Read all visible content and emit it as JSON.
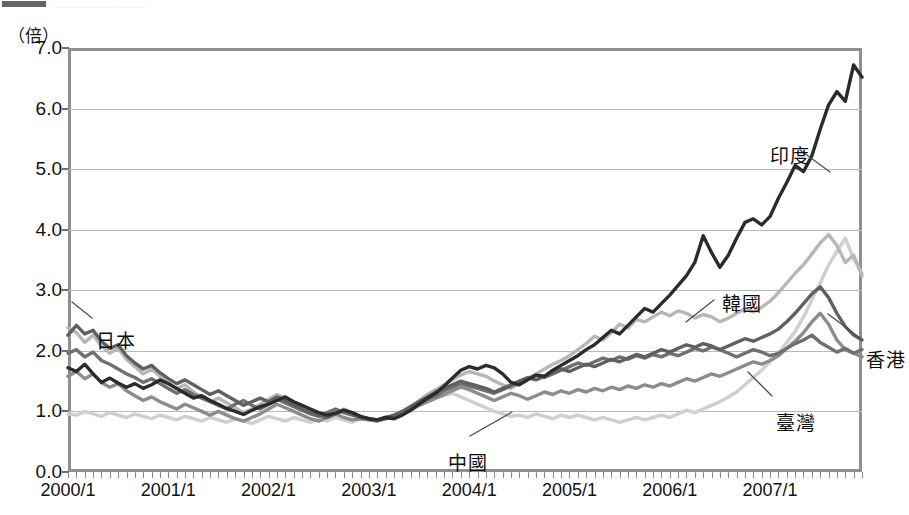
{
  "top_sliver": {
    "ghost_text": "................................."
  },
  "chart_data": {
    "type": "line",
    "title": "",
    "subtitle": "",
    "xlabel": "",
    "ylabel": "（倍）",
    "unit_label": "（倍）",
    "ylim": [
      0.0,
      7.0
    ],
    "ytick_labels": [
      "0.0",
      "1.0",
      "2.0",
      "3.0",
      "4.0",
      "5.0",
      "6.0",
      "7.0"
    ],
    "ytick_values": [
      0.0,
      1.0,
      2.0,
      3.0,
      4.0,
      5.0,
      6.0,
      7.0
    ],
    "grid": true,
    "legend_position": "inline-annotations",
    "xtick_labels": [
      "2000/1",
      "2001/1",
      "2002/1",
      "2003/1",
      "2004/1",
      "2005/1",
      "2006/1",
      "2007/1"
    ],
    "xtick_values": [
      0,
      12,
      24,
      36,
      48,
      60,
      72,
      84
    ],
    "x_minor_ticks": "monthly",
    "x_range_months": [
      0,
      95
    ],
    "series": [
      {
        "name": "印度",
        "name_en": "India",
        "color": "#2b2b2b",
        "width": 3.4,
        "label_x": 770,
        "label_y": 141,
        "leader": "M 800,150 L 830,172",
        "values": [
          1.72,
          1.66,
          1.78,
          1.62,
          1.48,
          1.55,
          1.47,
          1.4,
          1.46,
          1.38,
          1.44,
          1.52,
          1.46,
          1.38,
          1.3,
          1.22,
          1.26,
          1.18,
          1.12,
          1.05,
          1.0,
          0.95,
          1.02,
          1.08,
          1.12,
          1.18,
          1.24,
          1.16,
          1.1,
          1.04,
          0.98,
          0.94,
          0.97,
          1.02,
          0.98,
          0.92,
          0.88,
          0.86,
          0.9,
          0.88,
          0.94,
          1.02,
          1.12,
          1.22,
          1.3,
          1.42,
          1.55,
          1.68,
          1.74,
          1.7,
          1.76,
          1.72,
          1.62,
          1.48,
          1.44,
          1.52,
          1.6,
          1.58,
          1.68,
          1.76,
          1.84,
          1.92,
          2.02,
          2.1,
          2.22,
          2.34,
          2.28,
          2.42,
          2.56,
          2.7,
          2.64,
          2.78,
          2.92,
          3.08,
          3.24,
          3.46,
          3.9,
          3.62,
          3.38,
          3.58,
          3.86,
          4.12,
          4.18,
          4.08,
          4.22,
          4.52,
          4.78,
          5.06,
          4.96,
          5.22,
          5.66,
          6.06,
          6.28,
          6.12,
          6.72,
          6.52
        ]
      },
      {
        "name": "韓國",
        "name_en": "Korea",
        "color": "#b7b7b7",
        "width": 3.4,
        "label_x": 722,
        "label_y": 289,
        "leader": "M 714,300 L 686,322",
        "values": [
          2.38,
          2.3,
          2.14,
          2.26,
          2.08,
          1.96,
          2.04,
          1.86,
          1.74,
          1.62,
          1.7,
          1.58,
          1.46,
          1.38,
          1.44,
          1.32,
          1.24,
          1.16,
          1.22,
          1.14,
          1.06,
          0.98,
          1.04,
          1.12,
          1.2,
          1.28,
          1.22,
          1.14,
          1.08,
          1.02,
          0.96,
          0.92,
          0.98,
          1.04,
          0.98,
          0.92,
          0.88,
          0.85,
          0.9,
          0.92,
          0.98,
          1.08,
          1.18,
          1.28,
          1.36,
          1.44,
          1.52,
          1.6,
          1.66,
          1.62,
          1.58,
          1.5,
          1.44,
          1.38,
          1.46,
          1.54,
          1.62,
          1.7,
          1.78,
          1.84,
          1.92,
          2.02,
          2.12,
          2.24,
          2.18,
          2.3,
          2.44,
          2.38,
          2.52,
          2.48,
          2.56,
          2.64,
          2.58,
          2.66,
          2.62,
          2.54,
          2.6,
          2.56,
          2.48,
          2.54,
          2.62,
          2.7,
          2.64,
          2.72,
          2.82,
          2.96,
          3.12,
          3.28,
          3.42,
          3.6,
          3.78,
          3.92,
          3.74,
          3.46,
          3.58,
          3.24
        ]
      },
      {
        "name": "香港",
        "name_en": "Hong Kong",
        "color": "#707070",
        "width": 3.4,
        "label_x": 866,
        "label_y": 345,
        "leader": "M 860,338 L 828,314",
        "values": [
          1.96,
          2.02,
          1.9,
          1.98,
          1.84,
          1.78,
          1.7,
          1.62,
          1.56,
          1.48,
          1.54,
          1.46,
          1.38,
          1.3,
          1.36,
          1.28,
          1.22,
          1.16,
          1.1,
          1.04,
          1.12,
          1.18,
          1.1,
          1.04,
          1.12,
          1.2,
          1.14,
          1.08,
          1.02,
          0.96,
          0.92,
          0.98,
          1.04,
          0.98,
          0.94,
          0.9,
          0.87,
          0.85,
          0.88,
          0.92,
          0.96,
          1.04,
          1.12,
          1.2,
          1.26,
          1.34,
          1.4,
          1.46,
          1.42,
          1.38,
          1.34,
          1.3,
          1.36,
          1.42,
          1.48,
          1.54,
          1.6,
          1.56,
          1.62,
          1.68,
          1.74,
          1.8,
          1.76,
          1.82,
          1.88,
          1.84,
          1.9,
          1.86,
          1.92,
          1.88,
          1.94,
          1.9,
          1.96,
          1.92,
          1.98,
          2.04,
          2.0,
          2.06,
          2.02,
          1.96,
          1.9,
          1.96,
          2.02,
          1.98,
          1.92,
          1.96,
          2.04,
          2.12,
          2.18,
          2.26,
          2.14,
          2.06,
          1.98,
          2.04,
          1.96,
          2.02
        ]
      },
      {
        "name": "臺灣",
        "name_en": "Taiwan",
        "color": "#8c8c8c",
        "width": 3.4,
        "label_x": 776,
        "label_y": 408,
        "leader": "M 772,396 L 748,372",
        "values": [
          1.58,
          1.66,
          1.54,
          1.62,
          1.48,
          1.4,
          1.46,
          1.34,
          1.26,
          1.18,
          1.24,
          1.16,
          1.1,
          1.04,
          1.12,
          1.06,
          1.0,
          0.94,
          1.0,
          0.94,
          0.88,
          0.84,
          0.9,
          0.96,
          1.04,
          1.12,
          1.06,
          1.0,
          0.94,
          0.88,
          0.84,
          0.9,
          0.96,
          0.9,
          0.86,
          0.88,
          0.86,
          0.84,
          0.88,
          0.9,
          0.96,
          1.02,
          1.1,
          1.16,
          1.22,
          1.28,
          1.34,
          1.4,
          1.36,
          1.3,
          1.24,
          1.18,
          1.24,
          1.3,
          1.26,
          1.2,
          1.26,
          1.32,
          1.28,
          1.34,
          1.3,
          1.36,
          1.32,
          1.38,
          1.34,
          1.4,
          1.36,
          1.42,
          1.38,
          1.44,
          1.4,
          1.46,
          1.42,
          1.48,
          1.54,
          1.5,
          1.56,
          1.62,
          1.58,
          1.64,
          1.7,
          1.76,
          1.82,
          1.78,
          1.84,
          1.92,
          2.04,
          2.16,
          2.3,
          2.48,
          2.62,
          2.44,
          2.18,
          2.02,
          1.96,
          1.9
        ]
      },
      {
        "name": "日本",
        "name_en": "Japan",
        "color": "#606060",
        "width": 3.4,
        "label_x": 96,
        "label_y": 326,
        "leader": "M 92,318 L 72,302",
        "values": [
          2.26,
          2.42,
          2.28,
          2.34,
          2.16,
          2.04,
          2.1,
          1.92,
          1.8,
          1.7,
          1.76,
          1.64,
          1.54,
          1.46,
          1.52,
          1.44,
          1.36,
          1.28,
          1.34,
          1.26,
          1.18,
          1.1,
          1.16,
          1.22,
          1.16,
          1.24,
          1.18,
          1.1,
          1.04,
          0.98,
          0.94,
          0.9,
          0.96,
          1.02,
          0.96,
          0.9,
          0.88,
          0.86,
          0.9,
          0.94,
          1.0,
          1.08,
          1.16,
          1.24,
          1.32,
          1.38,
          1.44,
          1.5,
          1.46,
          1.42,
          1.38,
          1.32,
          1.38,
          1.44,
          1.5,
          1.56,
          1.52,
          1.58,
          1.64,
          1.7,
          1.66,
          1.72,
          1.78,
          1.74,
          1.8,
          1.86,
          1.82,
          1.88,
          1.94,
          1.9,
          1.96,
          2.02,
          1.98,
          2.04,
          2.1,
          2.06,
          2.12,
          2.08,
          2.02,
          2.08,
          2.14,
          2.2,
          2.16,
          2.22,
          2.28,
          2.36,
          2.48,
          2.62,
          2.78,
          2.94,
          3.06,
          2.88,
          2.62,
          2.4,
          2.26,
          2.18
        ]
      },
      {
        "name": "中國",
        "name_en": "China",
        "color": "#cfcfcf",
        "width": 3.4,
        "label_x": 448,
        "label_y": 448,
        "leader": "M 470,436 L 512,412",
        "values": [
          0.96,
          0.94,
          1.0,
          0.96,
          0.92,
          0.98,
          0.94,
          0.9,
          0.96,
          0.92,
          0.88,
          0.94,
          0.9,
          0.86,
          0.92,
          0.88,
          0.84,
          0.9,
          0.86,
          0.82,
          0.88,
          0.84,
          0.8,
          0.86,
          0.92,
          0.88,
          0.84,
          0.9,
          0.86,
          0.82,
          0.88,
          0.84,
          0.9,
          0.86,
          0.82,
          0.88,
          0.86,
          0.84,
          0.88,
          0.92,
          0.98,
          1.04,
          1.1,
          1.16,
          1.22,
          1.26,
          1.3,
          1.24,
          1.18,
          1.12,
          1.06,
          1.0,
          0.96,
          0.92,
          0.94,
          0.9,
          0.96,
          0.92,
          0.88,
          0.94,
          0.9,
          0.94,
          0.9,
          0.86,
          0.9,
          0.86,
          0.82,
          0.86,
          0.9,
          0.86,
          0.9,
          0.94,
          0.9,
          0.96,
          1.02,
          0.98,
          1.04,
          1.1,
          1.16,
          1.24,
          1.32,
          1.44,
          1.56,
          1.68,
          1.82,
          1.96,
          2.14,
          2.32,
          2.56,
          2.84,
          3.12,
          3.42,
          3.64,
          3.86,
          3.52,
          3.28
        ]
      }
    ]
  }
}
